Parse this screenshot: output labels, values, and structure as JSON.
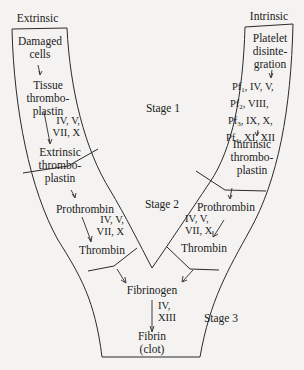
{
  "diagram": {
    "labels": {
      "extrinsic_header": "Extrinsic",
      "intrinsic_header": "Intrinsic",
      "stage1": "Stage 1",
      "stage2": "Stage 2",
      "stage3": "Stage 3"
    },
    "extrinsic": {
      "damaged_cells": [
        "Damaged",
        "cells"
      ],
      "tissue_thromboplastin": [
        "Tissue",
        "thrombo-",
        "plastin"
      ],
      "factors": [
        "IV, V,",
        "VII, X"
      ],
      "extrinsic_thromboplastin": [
        "Extrinsic",
        "thrombo-",
        "plastin"
      ],
      "prothrombin": "Prothrombin",
      "stage2_factors": [
        "IV, V,",
        "VII, X"
      ],
      "thrombin": "Thrombin"
    },
    "intrinsic": {
      "platelet_disintegration": [
        "Platelet",
        "disinte-",
        "gration"
      ],
      "factors": [
        {
          "pf": "Pf",
          "sub": "1",
          "rest": ", IV, V,"
        },
        {
          "pf": "Pf",
          "sub": "2",
          "rest": ", VIII,"
        },
        {
          "pf": "Pf",
          "sub": "3",
          "rest": ", IX, X,"
        },
        {
          "pf": "Pf",
          "sub": "4",
          "rest": ", XI, XII"
        }
      ],
      "intrinsic_thromboplastin": [
        "Intrinsic",
        "thrombo-",
        "plastin"
      ],
      "prothrombin": "Prothrombin",
      "stage2_factors": [
        "IV, V,",
        "VII, X"
      ],
      "thrombin": "Thrombin"
    },
    "common": {
      "fibrinogen": "Fibrinogen",
      "factors": [
        "IV,",
        "XIII"
      ],
      "fibrin": [
        "Fibrin",
        "(clot)"
      ]
    },
    "colors": {
      "line": "#2a2a2a",
      "background": "#f4f3f1",
      "text": "#222222"
    }
  }
}
